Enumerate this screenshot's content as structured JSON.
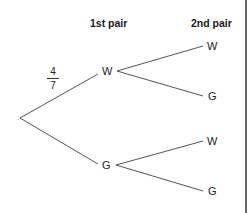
{
  "headers": {
    "first": "1st pair",
    "second": "2nd pair"
  },
  "branch_probability": {
    "numerator": "4",
    "denominator": "7"
  },
  "nodes": {
    "first_level": [
      "W",
      "G"
    ],
    "second_level_from_W": [
      "W",
      "G"
    ],
    "second_level_from_G": [
      "W",
      "G"
    ]
  },
  "colors": {
    "line": "#555555",
    "text": "#222222",
    "border": "#6a6a6a"
  }
}
